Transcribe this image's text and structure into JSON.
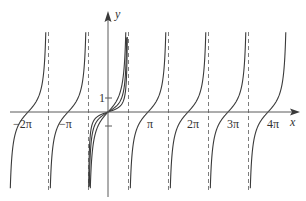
{
  "chart_data": {
    "type": "line",
    "title": "",
    "xlabel": "x",
    "ylabel": "y",
    "x_tick_labels": [
      "−2π",
      "−π",
      "π",
      "2π",
      "3π",
      "4π"
    ],
    "x_ticks": [
      -6.2832,
      -3.1416,
      3.1416,
      6.2832,
      9.4248,
      12.5664
    ],
    "y_tick_labels": [
      "1"
    ],
    "y_ticks": [
      1,
      -1
    ],
    "grid": false,
    "legend": null,
    "xlim": [
      -7.2,
      14.5
    ],
    "ylim": [
      -6.5,
      6.8
    ],
    "vertical_asymptotes": [
      -4.712,
      -1.571,
      1.571,
      4.712,
      7.854,
      10.996
    ],
    "series": [
      {
        "name": "tan(x) branches",
        "description": "periodic tangent-like branches with zeros at kπ for k=-2..4 and dashed asymptotes at odd multiples of π/2",
        "zeros": [
          -6.2832,
          -3.1416,
          0,
          3.1416,
          6.2832,
          9.4248,
          12.5664
        ]
      },
      {
        "name": "curve through origin (shallow 1)",
        "description": "additional curve through origin, less steep"
      },
      {
        "name": "curve through origin (shallow 2)",
        "description": "additional curve through origin, less steep"
      }
    ],
    "annotations": []
  },
  "axes": {
    "x_label": "x",
    "y_label": "y",
    "y_tick_one": "1"
  },
  "labels": {
    "neg2pi": "−2π",
    "negpi": "−π",
    "pi": "π",
    "twopi": "2π",
    "threepi": "3π",
    "fourpi": "4π"
  },
  "colors": {
    "curve": "#3a3a3a",
    "axis": "#5a5a5a",
    "asymptote": "#6e6e6e"
  }
}
